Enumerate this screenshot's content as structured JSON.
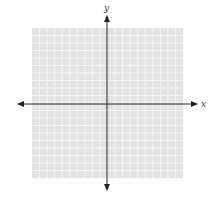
{
  "diagram": {
    "type": "coordinate-plane",
    "x_axis_label": "x",
    "y_axis_label": "y",
    "grid": {
      "cells_x": 20,
      "cells_y": 20,
      "left": 32,
      "top": 28,
      "right": 183,
      "bottom": 178,
      "fill_color": "#e3e3e3",
      "line_color": "#f7f7f7"
    },
    "origin": {
      "x": 107,
      "y": 104
    },
    "axes": {
      "color": "#222222",
      "x_start": 17,
      "x_end": 198,
      "y_start": 15,
      "y_end": 191
    }
  }
}
